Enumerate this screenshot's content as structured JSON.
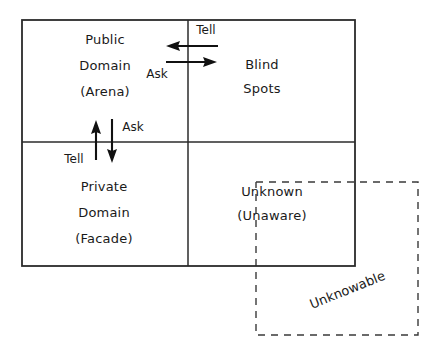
{
  "diagram": {
    "type": "quadrant-matrix",
    "colors": {
      "stroke": "#2b2b2b",
      "dashed_stroke": "#3a3a3a",
      "arrow": "#111111",
      "text": "#1a1a1a",
      "background": "#ffffff"
    },
    "quadrants": [
      {
        "id": "public-domain",
        "position": "top-left",
        "lines": [
          "Public",
          "Domain",
          "(Arena)"
        ]
      },
      {
        "id": "blind-spots",
        "position": "top-right",
        "lines": [
          "Blind",
          "Spots"
        ]
      },
      {
        "id": "private-domain",
        "position": "bottom-left",
        "lines": [
          "Private",
          "Domain",
          "(Facade)"
        ]
      },
      {
        "id": "unknown",
        "position": "bottom-right",
        "lines": [
          "Unknown",
          "(Unaware)"
        ]
      }
    ],
    "outer_region": {
      "id": "unknowable",
      "label": "Unknowable",
      "style": "dashed",
      "rotation_deg": -22
    },
    "arrows": [
      {
        "id": "tell-horizontal",
        "label": "Tell",
        "direction": "left",
        "from": "blind-spots",
        "to": "public-domain"
      },
      {
        "id": "ask-horizontal",
        "label": "Ask",
        "direction": "right",
        "from": "public-domain",
        "to": "blind-spots"
      },
      {
        "id": "tell-vertical",
        "label": "Tell",
        "direction": "up",
        "from": "private-domain",
        "to": "public-domain"
      },
      {
        "id": "ask-vertical",
        "label": "Ask",
        "direction": "down",
        "from": "public-domain",
        "to": "private-domain"
      }
    ]
  }
}
